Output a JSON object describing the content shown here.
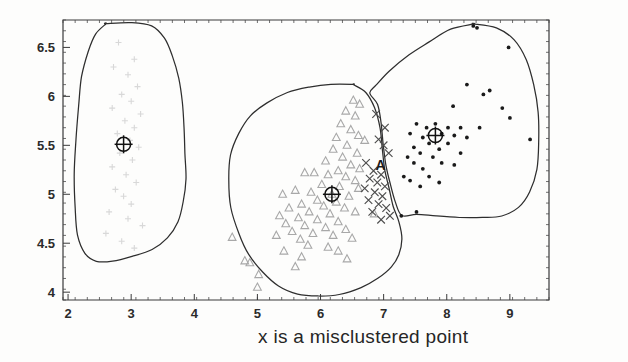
{
  "caption": "x is a misclustered point",
  "annotations": [
    {
      "label": "A",
      "x": 6.95,
      "y": 5.25
    }
  ],
  "chart_data": {
    "type": "scatter",
    "title": "",
    "xlabel": "",
    "ylabel": "",
    "xlim": [
      1.92,
      9.62
    ],
    "ylim": [
      3.92,
      6.78
    ],
    "xticks": [
      2,
      3,
      4,
      5,
      6,
      7,
      8,
      9
    ],
    "xtick_labels": [
      "2",
      "3",
      "4",
      "5",
      "6",
      "7",
      "8",
      "9"
    ],
    "yticks": [
      4,
      4.5,
      5,
      5.5,
      6,
      6.5
    ],
    "ytick_labels": [
      "4",
      "4.5",
      "5",
      "5.5",
      "6",
      "6.5"
    ],
    "grid": false,
    "legend": "none",
    "caption": "x is a misclustered point",
    "series": [
      {
        "name": "cluster-1-plus",
        "marker": "plus",
        "color": "#d8d8d8",
        "points": [
          [
            2.8,
            6.55
          ],
          [
            3.05,
            6.38
          ],
          [
            2.72,
            6.3
          ],
          [
            2.95,
            6.22
          ],
          [
            3.1,
            6.1
          ],
          [
            2.85,
            6.02
          ],
          [
            3.0,
            5.95
          ],
          [
            2.7,
            5.88
          ],
          [
            3.15,
            5.82
          ],
          [
            2.9,
            5.75
          ],
          [
            3.05,
            5.68
          ],
          [
            2.78,
            5.62
          ],
          [
            2.98,
            5.55
          ],
          [
            3.12,
            5.48
          ],
          [
            2.82,
            5.42
          ],
          [
            3.02,
            5.35
          ],
          [
            2.7,
            5.28
          ],
          [
            2.92,
            5.2
          ],
          [
            3.08,
            5.12
          ],
          [
            2.75,
            5.05
          ],
          [
            2.88,
            4.98
          ],
          [
            3.0,
            4.9
          ],
          [
            2.65,
            4.82
          ],
          [
            2.95,
            4.75
          ],
          [
            3.18,
            4.68
          ],
          [
            2.6,
            4.6
          ],
          [
            2.85,
            4.52
          ],
          [
            3.05,
            4.45
          ]
        ]
      },
      {
        "name": "cluster-2-triangle",
        "marker": "triangle",
        "color": "#a8a8a8",
        "points": [
          [
            6.4,
            5.85
          ],
          [
            6.55,
            5.8
          ],
          [
            6.32,
            5.72
          ],
          [
            6.48,
            5.66
          ],
          [
            6.6,
            5.6
          ],
          [
            6.25,
            5.58
          ],
          [
            6.7,
            5.55
          ],
          [
            6.42,
            5.5
          ],
          [
            6.2,
            5.46
          ],
          [
            6.58,
            5.42
          ],
          [
            6.35,
            5.38
          ],
          [
            6.08,
            5.34
          ],
          [
            6.48,
            5.3
          ],
          [
            6.62,
            5.26
          ],
          [
            6.28,
            5.24
          ],
          [
            5.9,
            5.22
          ],
          [
            6.12,
            5.2
          ],
          [
            6.4,
            5.18
          ],
          [
            6.55,
            5.14
          ],
          [
            5.75,
            5.22
          ],
          [
            6.02,
            5.1
          ],
          [
            6.3,
            5.08
          ],
          [
            6.6,
            5.06
          ],
          [
            5.85,
            5.02
          ],
          [
            6.18,
            5.0
          ],
          [
            6.45,
            4.98
          ],
          [
            5.6,
            5.04
          ],
          [
            5.95,
            4.94
          ],
          [
            6.25,
            4.92
          ],
          [
            5.4,
            5.0
          ],
          [
            5.7,
            4.9
          ],
          [
            6.05,
            4.88
          ],
          [
            6.38,
            4.86
          ],
          [
            5.5,
            4.86
          ],
          [
            5.82,
            4.82
          ],
          [
            6.15,
            4.8
          ],
          [
            6.55,
            4.82
          ],
          [
            5.35,
            4.78
          ],
          [
            5.65,
            4.76
          ],
          [
            5.95,
            4.74
          ],
          [
            6.28,
            4.72
          ],
          [
            6.85,
            4.8
          ],
          [
            5.45,
            4.7
          ],
          [
            5.75,
            4.68
          ],
          [
            6.08,
            4.66
          ],
          [
            6.4,
            4.64
          ],
          [
            5.55,
            4.62
          ],
          [
            5.88,
            4.6
          ],
          [
            6.2,
            4.58
          ],
          [
            4.6,
            4.56
          ],
          [
            5.3,
            4.58
          ],
          [
            5.68,
            4.54
          ],
          [
            6.5,
            4.55
          ],
          [
            5.8,
            4.48
          ],
          [
            6.12,
            4.46
          ],
          [
            4.8,
            4.32
          ],
          [
            4.88,
            4.3
          ],
          [
            5.42,
            4.42
          ],
          [
            6.28,
            4.42
          ],
          [
            5.7,
            4.36
          ],
          [
            6.42,
            4.34
          ],
          [
            5.02,
            4.18
          ],
          [
            5.6,
            4.26
          ],
          [
            5.0,
            4.05
          ],
          [
            6.62,
            5.92
          ],
          [
            6.52,
            5.96
          ]
        ]
      },
      {
        "name": "cluster-2-misclustered",
        "marker": "cross",
        "color": "#4d4d4d",
        "points": [
          [
            6.88,
            5.82
          ],
          [
            7.02,
            5.68
          ],
          [
            6.92,
            5.56
          ],
          [
            7.08,
            5.42
          ],
          [
            6.72,
            5.32
          ],
          [
            6.84,
            5.24
          ],
          [
            6.96,
            5.2
          ],
          [
            6.78,
            5.16
          ],
          [
            6.9,
            5.12
          ],
          [
            7.02,
            5.08
          ],
          [
            6.7,
            5.06
          ],
          [
            6.86,
            5.02
          ],
          [
            6.98,
            4.98
          ],
          [
            6.76,
            4.94
          ],
          [
            6.92,
            4.9
          ],
          [
            7.04,
            4.86
          ],
          [
            6.82,
            4.82
          ],
          [
            7.1,
            4.78
          ],
          [
            6.96,
            4.74
          ],
          [
            7.0,
            5.5
          ]
        ]
      },
      {
        "name": "cluster-3-dot",
        "marker": "dot",
        "color": "#1a1a1a",
        "points": [
          [
            8.42,
            6.72
          ],
          [
            8.98,
            6.5
          ],
          [
            8.32,
            6.12
          ],
          [
            8.58,
            6.02
          ],
          [
            8.1,
            5.9
          ],
          [
            8.88,
            5.88
          ],
          [
            9.0,
            5.78
          ],
          [
            7.52,
            5.72
          ],
          [
            7.82,
            5.72
          ],
          [
            7.68,
            5.68
          ],
          [
            8.02,
            5.68
          ],
          [
            8.22,
            5.68
          ],
          [
            8.52,
            5.68
          ],
          [
            7.42,
            5.62
          ],
          [
            7.92,
            5.62
          ],
          [
            8.12,
            5.6
          ],
          [
            7.62,
            5.58
          ],
          [
            8.32,
            5.58
          ],
          [
            9.32,
            5.56
          ],
          [
            7.72,
            5.52
          ],
          [
            8.02,
            5.52
          ],
          [
            7.48,
            5.48
          ],
          [
            7.88,
            5.46
          ],
          [
            7.58,
            5.42
          ],
          [
            8.22,
            5.42
          ],
          [
            7.38,
            5.38
          ],
          [
            7.78,
            5.38
          ],
          [
            7.48,
            5.32
          ],
          [
            7.92,
            5.32
          ],
          [
            8.12,
            5.3
          ],
          [
            7.62,
            5.26
          ],
          [
            7.32,
            5.18
          ],
          [
            7.72,
            5.18
          ],
          [
            7.42,
            5.14
          ],
          [
            7.88,
            5.12
          ],
          [
            7.58,
            5.08
          ],
          [
            7.52,
            4.82
          ],
          [
            7.28,
            4.78
          ],
          [
            8.48,
            6.7
          ],
          [
            8.68,
            6.06
          ]
        ]
      }
    ],
    "centroids": [
      {
        "name": "centroid-cluster-1",
        "x": 2.88,
        "y": 5.51
      },
      {
        "name": "centroid-cluster-2",
        "x": 6.18,
        "y": 5.0
      },
      {
        "name": "centroid-cluster-3",
        "x": 7.82,
        "y": 5.6
      }
    ],
    "boundaries": [
      {
        "name": "boundary-cluster-1",
        "points": [
          [
            2.6,
            6.74
          ],
          [
            3.0,
            6.76
          ],
          [
            3.32,
            6.72
          ],
          [
            3.52,
            6.6
          ],
          [
            3.66,
            6.42
          ],
          [
            3.76,
            6.18
          ],
          [
            3.8,
            5.94
          ],
          [
            3.84,
            5.68
          ],
          [
            3.86,
            5.42
          ],
          [
            3.86,
            5.16
          ],
          [
            3.82,
            4.92
          ],
          [
            3.74,
            4.72
          ],
          [
            3.58,
            4.56
          ],
          [
            3.34,
            4.44
          ],
          [
            3.02,
            4.36
          ],
          [
            2.7,
            4.32
          ],
          [
            2.44,
            4.32
          ],
          [
            2.26,
            4.4
          ],
          [
            2.16,
            4.58
          ],
          [
            2.12,
            4.86
          ],
          [
            2.1,
            5.2
          ],
          [
            2.12,
            5.56
          ],
          [
            2.16,
            5.9
          ],
          [
            2.22,
            6.2
          ],
          [
            2.32,
            6.46
          ],
          [
            2.44,
            6.64
          ],
          [
            2.6,
            6.74
          ]
        ]
      },
      {
        "name": "boundary-cluster-2",
        "points": [
          [
            6.52,
            6.12
          ],
          [
            6.72,
            6.04
          ],
          [
            6.86,
            5.88
          ],
          [
            6.94,
            5.68
          ],
          [
            6.98,
            5.46
          ],
          [
            7.02,
            5.24
          ],
          [
            7.08,
            5.06
          ],
          [
            7.16,
            4.88
          ],
          [
            7.24,
            4.72
          ],
          [
            7.28,
            4.54
          ],
          [
            7.24,
            4.38
          ],
          [
            7.12,
            4.26
          ],
          [
            6.92,
            4.14
          ],
          [
            6.64,
            4.04
          ],
          [
            6.3,
            3.98
          ],
          [
            5.96,
            3.96
          ],
          [
            5.64,
            3.98
          ],
          [
            5.34,
            4.06
          ],
          [
            5.08,
            4.2
          ],
          [
            4.86,
            4.38
          ],
          [
            4.7,
            4.6
          ],
          [
            4.58,
            4.86
          ],
          [
            4.54,
            5.14
          ],
          [
            4.58,
            5.4
          ],
          [
            4.7,
            5.62
          ],
          [
            4.9,
            5.8
          ],
          [
            5.16,
            5.94
          ],
          [
            5.48,
            6.04
          ],
          [
            5.82,
            6.1
          ],
          [
            6.16,
            6.13
          ],
          [
            6.52,
            6.12
          ]
        ]
      },
      {
        "name": "boundary-cluster-3",
        "points": [
          [
            8.42,
            6.74
          ],
          [
            8.78,
            6.7
          ],
          [
            9.06,
            6.58
          ],
          [
            9.26,
            6.38
          ],
          [
            9.38,
            6.12
          ],
          [
            9.44,
            5.84
          ],
          [
            9.46,
            5.54
          ],
          [
            9.42,
            5.26
          ],
          [
            9.32,
            5.02
          ],
          [
            9.14,
            4.86
          ],
          [
            8.88,
            4.78
          ],
          [
            8.56,
            4.76
          ],
          [
            8.2,
            4.76
          ],
          [
            7.84,
            4.78
          ],
          [
            7.52,
            4.8
          ],
          [
            7.28,
            4.78
          ],
          [
            7.18,
            4.92
          ],
          [
            7.1,
            5.1
          ],
          [
            7.04,
            5.3
          ],
          [
            7.0,
            5.52
          ],
          [
            6.96,
            5.74
          ],
          [
            6.9,
            5.92
          ],
          [
            6.78,
            6.04
          ],
          [
            6.88,
            6.12
          ],
          [
            7.1,
            6.26
          ],
          [
            7.4,
            6.42
          ],
          [
            7.72,
            6.56
          ],
          [
            8.06,
            6.68
          ],
          [
            8.42,
            6.74
          ]
        ]
      }
    ]
  }
}
